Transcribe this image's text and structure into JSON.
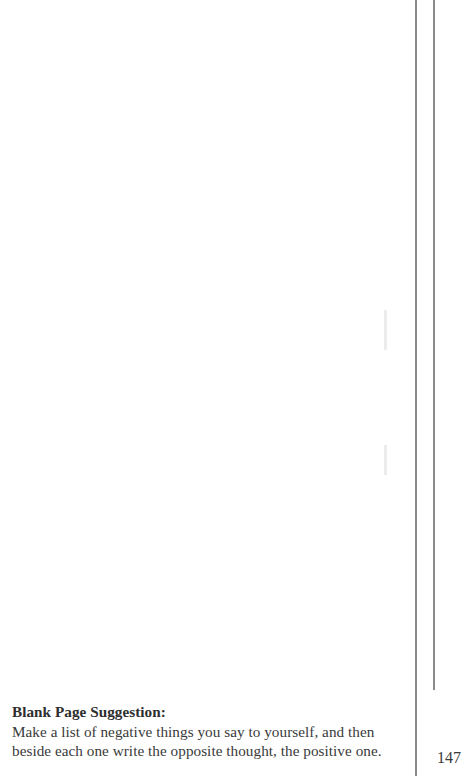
{
  "page": {
    "number": "147",
    "background": "#ffffff",
    "rule_color": "#8a8a8a"
  },
  "suggestion": {
    "heading": "Blank Page Suggestion:",
    "body": "Make a list of negative things you say to yourself, and then beside each one write the opposite thought, the positive one."
  }
}
